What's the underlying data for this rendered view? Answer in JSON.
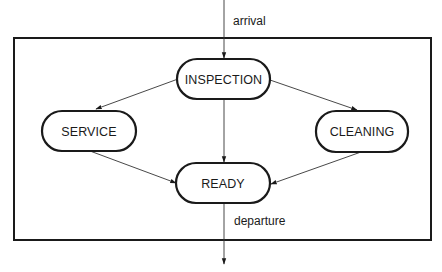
{
  "diagram": {
    "type": "state-flow",
    "colors": {
      "stroke": "#1a1a1a",
      "edge": "#333333",
      "background": "#ffffff"
    },
    "nodes": {
      "inspection": {
        "label": "INSPECTION"
      },
      "service": {
        "label": "SERVICE"
      },
      "cleaning": {
        "label": "CLEANING"
      },
      "ready": {
        "label": "READY"
      }
    },
    "edges": [
      {
        "from": "external",
        "to": "inspection",
        "label": "arrival"
      },
      {
        "from": "inspection",
        "to": "service",
        "label": ""
      },
      {
        "from": "inspection",
        "to": "cleaning",
        "label": ""
      },
      {
        "from": "inspection",
        "to": "ready",
        "label": ""
      },
      {
        "from": "service",
        "to": "ready",
        "label": ""
      },
      {
        "from": "cleaning",
        "to": "ready",
        "label": ""
      },
      {
        "from": "ready",
        "to": "external",
        "label": "departure"
      }
    ],
    "labels": {
      "arrival": "arrival",
      "departure": "departure"
    }
  }
}
